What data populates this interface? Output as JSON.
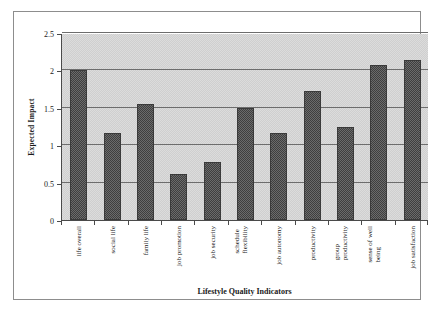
{
  "chart_data": {
    "type": "bar",
    "title": "",
    "xlabel": "Lifestyle Quality Indicators",
    "ylabel": "Expected Impact",
    "ylim": [
      0,
      2.5
    ],
    "ytick_labels": [
      "0",
      "0.5",
      "1",
      "1.5",
      "2",
      "2.5"
    ],
    "ytick_values": [
      0,
      0.5,
      1,
      1.5,
      2,
      2.5
    ],
    "grid": true,
    "legend": "none",
    "categories": [
      "life overall",
      "social life",
      "family life",
      "job promotion",
      "job security",
      "schedule\nflexibility",
      "job autonomy",
      "productivity",
      "group\nproductivity",
      "sense of well\nbeing",
      "job satisfaction"
    ],
    "values": [
      2.0,
      1.16,
      1.55,
      0.61,
      0.77,
      1.5,
      1.16,
      1.72,
      1.24,
      2.07,
      2.14
    ],
    "series": [
      {
        "name": "Expected Impact",
        "values": [
          2.0,
          1.16,
          1.55,
          0.61,
          0.77,
          1.5,
          1.16,
          1.72,
          1.24,
          2.07,
          2.14
        ]
      }
    ]
  },
  "colors": {
    "bar_fill": "#6b6b6b",
    "bar_edge": "#3a3a3a",
    "plot_background": "#dcdcdc",
    "gridline": "#6d6d6d",
    "axis": "#4a4a4a",
    "frame": "#8d8d8d",
    "text": "#1a1a1a"
  }
}
